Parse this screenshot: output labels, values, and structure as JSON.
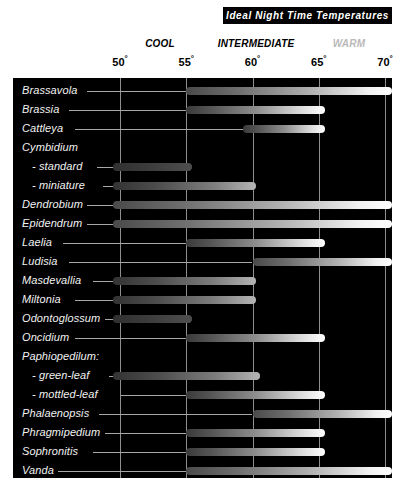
{
  "title": "Ideal Night Time Temperatures",
  "bands": [
    {
      "name": "cool-band-label",
      "label": "COOL"
    },
    {
      "name": "intermediate-band-label",
      "label": "INTERMEDIATE"
    },
    {
      "name": "warm-band-label",
      "label": "WARM"
    }
  ],
  "ticks": [
    {
      "value": 50,
      "label": "50"
    },
    {
      "value": 55,
      "label": "55"
    },
    {
      "value": 60,
      "label": "60"
    },
    {
      "value": 65,
      "label": "65"
    },
    {
      "value": 70,
      "label": "70"
    }
  ],
  "degree_symbol": "°",
  "colors": {
    "panel_background": "#000000",
    "gridline": "#8f8f8f",
    "label_text": "#f2f2f2",
    "title_background": "#000000",
    "title_text": "#ffffff",
    "band_cool": "#000000",
    "band_intermediate": "#000000",
    "band_warm": "#b9b9b9",
    "bar_cold_end": "#303030",
    "bar_warm_end": "#ffffff"
  },
  "chart_data": {
    "type": "bar",
    "orientation": "horizontal",
    "title": "Ideal Night Time Temperatures",
    "xlabel": "",
    "ylabel": "",
    "xlim": [
      48,
      71
    ],
    "xticks": [
      50,
      55,
      60,
      65,
      70
    ],
    "xtick_labels": [
      "50°",
      "55°",
      "60°",
      "65°",
      "70°"
    ],
    "grid": true,
    "legend": "none",
    "value_unit": "degrees Fahrenheit",
    "band_ranges": [
      {
        "name": "COOL",
        "approx_center": 52.5
      },
      {
        "name": "INTERMEDIATE",
        "approx_center": 60
      },
      {
        "name": "WARM",
        "approx_center": 68
      }
    ],
    "categories": [
      "Brassavola",
      "Brassia",
      "Cattleya",
      "Cymbidium",
      "- standard",
      "- miniature",
      "Dendrobium",
      "Epidendrum",
      "Laelia",
      "Ludisia",
      "Masdevallia",
      "Miltonia",
      "Odontoglossum",
      "Oncidium",
      "Paphiopedilum:",
      "- green-leaf",
      "- mottled-leaf",
      "Phalaenopsis",
      "Phragmipedium",
      "Sophronitis",
      "Vanda"
    ],
    "rows": [
      {
        "label": "Brassavola",
        "indent": 0,
        "has_bar": true,
        "start": 55.0,
        "end": 70.5
      },
      {
        "label": "Brassia",
        "indent": 0,
        "has_bar": true,
        "start": 55.0,
        "end": 65.5
      },
      {
        "label": "Cattleya",
        "indent": 0,
        "has_bar": true,
        "start": 59.3,
        "end": 65.5
      },
      {
        "label": "Cymbidium",
        "indent": 0,
        "has_bar": false,
        "start": null,
        "end": null
      },
      {
        "label": "- standard",
        "indent": 1,
        "has_bar": true,
        "start": 49.5,
        "end": 55.4
      },
      {
        "label": "- miniature",
        "indent": 1,
        "has_bar": true,
        "start": 49.5,
        "end": 60.3
      },
      {
        "label": "Dendrobium",
        "indent": 0,
        "has_bar": true,
        "start": 49.5,
        "end": 70.5
      },
      {
        "label": "Epidendrum",
        "indent": 0,
        "has_bar": true,
        "start": 49.5,
        "end": 70.5
      },
      {
        "label": "Laelia",
        "indent": 0,
        "has_bar": true,
        "start": 55.0,
        "end": 65.5
      },
      {
        "label": "Ludisia",
        "indent": 0,
        "has_bar": true,
        "start": 60.0,
        "end": 70.5
      },
      {
        "label": "Masdevallia",
        "indent": 0,
        "has_bar": true,
        "start": 49.5,
        "end": 60.3
      },
      {
        "label": "Miltonia",
        "indent": 0,
        "has_bar": true,
        "start": 49.5,
        "end": 60.3
      },
      {
        "label": "Odontoglossum",
        "indent": 0,
        "has_bar": true,
        "start": 49.5,
        "end": 55.4
      },
      {
        "label": "Oncidium",
        "indent": 0,
        "has_bar": true,
        "start": 55.0,
        "end": 65.5
      },
      {
        "label": "Paphiopedilum:",
        "indent": 0,
        "has_bar": false,
        "start": null,
        "end": null
      },
      {
        "label": "- green-leaf",
        "indent": 1,
        "has_bar": true,
        "start": 49.5,
        "end": 60.6
      },
      {
        "label": "- mottled-leaf",
        "indent": 1,
        "has_bar": true,
        "start": 55.0,
        "end": 65.5
      },
      {
        "label": "Phalaenopsis",
        "indent": 0,
        "has_bar": true,
        "start": 60.0,
        "end": 70.5
      },
      {
        "label": "Phragmipedium",
        "indent": 0,
        "has_bar": true,
        "start": 55.0,
        "end": 65.5
      },
      {
        "label": "Sophronitis",
        "indent": 0,
        "has_bar": true,
        "start": 55.0,
        "end": 65.5
      },
      {
        "label": "Vanda",
        "indent": 0,
        "has_bar": true,
        "start": 55.0,
        "end": 70.5
      }
    ]
  }
}
